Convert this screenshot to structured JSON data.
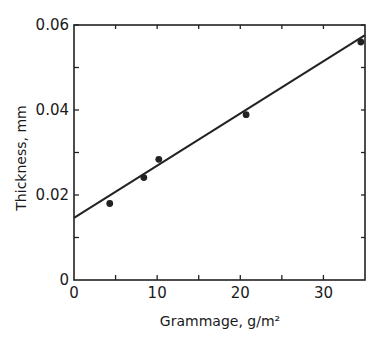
{
  "chart_data": {
    "type": "scatter",
    "title": "",
    "xlabel": "Grammage, g/m²",
    "ylabel": "Thickness, mm",
    "xlim": [
      0,
      35
    ],
    "ylim": [
      0,
      0.06
    ],
    "x_ticks": [
      0,
      10,
      20,
      30
    ],
    "x_tick_labels": [
      "0",
      "10",
      "20",
      "30"
    ],
    "x_minor_ticks": [
      5,
      15,
      25
    ],
    "y_ticks": [
      0,
      0.02,
      0.04,
      0.06
    ],
    "y_tick_labels": [
      "0",
      "0.02",
      "0.04",
      "0.06"
    ],
    "y_minor_ticks": [
      0.01,
      0.03,
      0.05
    ],
    "grid": false,
    "legend": null,
    "series": [
      {
        "name": "measured",
        "kind": "points",
        "x": [
          4.3,
          8.4,
          10.2,
          20.7,
          34.5
        ],
        "y": [
          0.018,
          0.0241,
          0.0284,
          0.0389,
          0.056
        ]
      },
      {
        "name": "linear fit",
        "kind": "line",
        "x": [
          0,
          35
        ],
        "y": [
          0.0146,
          0.0576
        ]
      }
    ]
  }
}
